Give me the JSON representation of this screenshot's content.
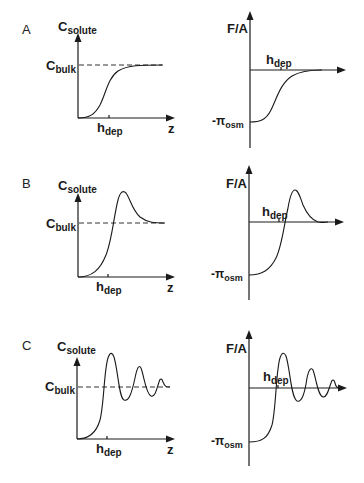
{
  "figure": {
    "panels": [
      {
        "id": "A",
        "label": "A",
        "left": {
          "y_label_main": "C",
          "y_label_sub": "solute",
          "ref_label_main": "C",
          "ref_label_sub": "bulk",
          "x_tick_main": "h",
          "x_tick_sub": "dep",
          "x_label": "z"
        },
        "right": {
          "y_label": "F/A",
          "x_tick_main": "h",
          "x_tick_sub": "dep",
          "ref_label_prefix": "-π",
          "ref_label_sub": "osm"
        }
      },
      {
        "id": "B",
        "label": "B",
        "left": {
          "y_label_main": "C",
          "y_label_sub": "solute",
          "ref_label_main": "C",
          "ref_label_sub": "bulk",
          "x_tick_main": "h",
          "x_tick_sub": "dep",
          "x_label": "z"
        },
        "right": {
          "y_label": "F/A",
          "x_tick_main": "h",
          "x_tick_sub": "dep",
          "ref_label_prefix": "-π",
          "ref_label_sub": "osm"
        }
      },
      {
        "id": "C",
        "label": "C",
        "left": {
          "y_label_main": "C",
          "y_label_sub": "solute",
          "ref_label_main": "C",
          "ref_label_sub": "bulk",
          "x_tick_main": "h",
          "x_tick_sub": "dep",
          "x_label": "z"
        },
        "right": {
          "y_label": "F/A",
          "x_tick_main": "h",
          "x_tick_sub": "dep",
          "ref_label_prefix": "-π",
          "ref_label_sub": "osm"
        }
      }
    ],
    "descriptions": {
      "A": "Monotonic sigmoidal depletion: solute concentration rises from 0 to C_bulk; force per area rises from -π_osm to 0 (purely attractive).",
      "B": "Single overshoot: concentration peaks above C_bulk near h_dep then decays to C_bulk; force crosses zero and shows a repulsive maximum.",
      "C": "Damped oscillation: concentration oscillates about C_bulk; force oscillates about zero with decaying amplitude."
    }
  }
}
